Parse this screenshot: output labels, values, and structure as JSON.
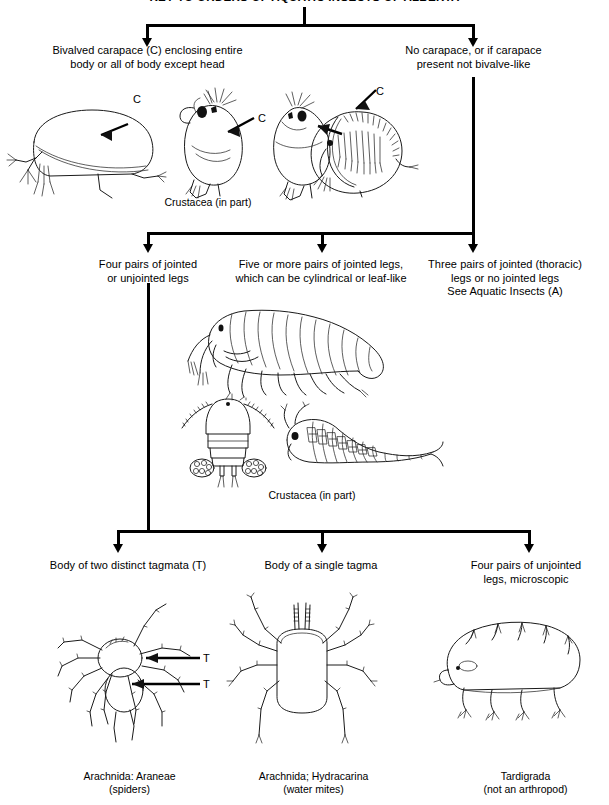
{
  "title": "KEY TO ORDERS OF AQUATIC INSECTS OF ALBERTA",
  "level1": {
    "left_label": "Bivalved carapace (C) enclosing entire\nbody or all of body except head",
    "right_label": "No carapace, or if carapace\npresent not bivalve-like",
    "left_result": "Crustacea (in part)",
    "carapace_marks": [
      "C",
      "C",
      "C"
    ]
  },
  "level2": {
    "left_label": "Four pairs of jointed\nor unjointed legs",
    "middle_label": "Five or more pairs of jointed legs,\nwhich can be cylindrical or leaf-like",
    "right_label": "Three pairs of jointed (thoracic)\nlegs or no jointed legs\nSee Aquatic Insects (A)",
    "middle_result": "Crustacea (in part)"
  },
  "level3": {
    "left_label": "Body of two distinct tagmata (T)",
    "middle_label": "Body of a single tagma",
    "right_label": "Four pairs of unjointed\nlegs, microscopic",
    "tagma_marks": [
      "T",
      "T"
    ],
    "left_result": "Arachnida: Araneae\n(spiders)",
    "middle_result": "Arachnida; Hydracarina\n(water mites)",
    "right_result": "Tardigrada\n(not an arthropod)"
  },
  "figures": {
    "ostracod": "ostracod-drawing",
    "cladoceran_a": "cladoceran-drawing",
    "cladoceran_b": "cladoceran-drawing-2",
    "conchostracan": "clam-shrimp-drawing",
    "amphipod": "amphipod-drawing",
    "copepod": "copepod-drawing",
    "fairy_shrimp": "fairy-shrimp-drawing",
    "spider": "spider-drawing",
    "water_mite": "water-mite-drawing",
    "tardigrade": "tardigrade-drawing"
  }
}
